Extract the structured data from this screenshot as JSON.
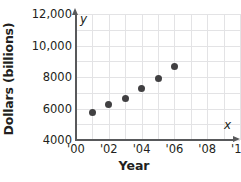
{
  "chart_data": {
    "type": "scatter",
    "title": "",
    "xlabel": "Year",
    "ylabel": "Dollars (billions)",
    "axis_name_x": "x",
    "axis_name_y": "y",
    "x": [
      2001,
      2002,
      2003,
      2004,
      2005,
      2006
    ],
    "values": [
      5750,
      6250,
      6650,
      7300,
      7900,
      8650
    ],
    "xlim": [
      2000,
      2010
    ],
    "ylim": [
      4000,
      12000
    ],
    "xtick_labels": [
      "'00",
      "'02",
      "'04",
      "'06",
      "'08",
      "'10"
    ],
    "xtick_values": [
      2000,
      2002,
      2004,
      2006,
      2008,
      2010
    ],
    "ytick_labels": [
      "12,000",
      "10,000",
      "8000",
      "6000",
      "4000"
    ],
    "ytick_values": [
      12000,
      10000,
      8000,
      6000,
      4000
    ],
    "grid": true,
    "grid_x_step": 1,
    "grid_y_step": 1000,
    "legend": null,
    "marker_color": "#414042",
    "grid_color": "#e3e3e5",
    "axis_color": "#58595b",
    "text_color": "#231f20",
    "background": "#ffffff"
  }
}
